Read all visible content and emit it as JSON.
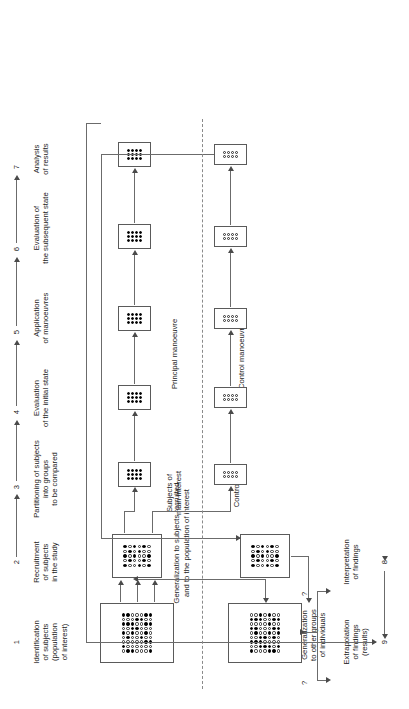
{
  "figure": {
    "orientation": "rotated-90",
    "stages": [
      {
        "num": "1",
        "label": "Identification\nof subjects\n(population\nof interest)"
      },
      {
        "num": "2",
        "label": "Recruitment\nof subjects\nin the study"
      },
      {
        "num": "3",
        "label": "Partitioning of subjects\ninto groups\nto be compared"
      },
      {
        "num": "4",
        "label": "Evaluation\nof the initial state"
      },
      {
        "num": "5",
        "label": "Application\nof manoeuvres"
      },
      {
        "num": "6",
        "label": "Evaluation of\nthe subsequent state"
      },
      {
        "num": "7",
        "label": "Analysis\nof results"
      },
      {
        "num": "8",
        "label": "Interpretation\nof findings"
      },
      {
        "num": "9",
        "label": "Extrapolation\nof findings\n(results)"
      }
    ],
    "row_labels": {
      "principal": "Principal manoeuvre",
      "control": "Control manoeuvre",
      "subjects_main": "Subjects of\nmain interest",
      "controls": "Controls"
    },
    "annotations": {
      "generalization_population": "Generalization to subjects recruited\nand to the population of interest",
      "generalization_other": "Generalization\nto other groups\nof individuals",
      "question_left": "?",
      "question_right": "?"
    },
    "colors": {
      "line": "#6b6b6b",
      "box_border": "#5a5a5a",
      "dot_filled": "#000000",
      "dot_open_border": "#2b2b2b",
      "text": "#1a1a1a",
      "separator": "#8a8a8a"
    },
    "boxes": {
      "population": {
        "name": "population-of-interest",
        "cols": 9,
        "rows": 7,
        "dot_size": 3.4
      },
      "recruited": {
        "name": "recruited-subjects",
        "cols": 5,
        "rows": 6,
        "dot_size": 3.6
      },
      "extrapolation": {
        "name": "extrapolation-population",
        "cols": 9,
        "rows": 7,
        "dot_size": 3.4
      },
      "interpretation": {
        "name": "interpretation-sample",
        "cols": 5,
        "rows": 6,
        "dot_size": 3.6
      },
      "principal": {
        "name": "principal-group",
        "cols": 3,
        "rows": 4,
        "dot_size": 3.0
      },
      "control": {
        "name": "control-group",
        "cols": 2,
        "rows": 4,
        "dot_size": 3.0
      }
    }
  }
}
